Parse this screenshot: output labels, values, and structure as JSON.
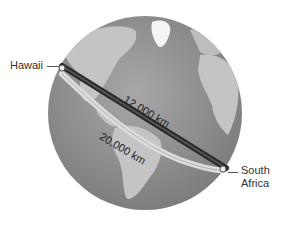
{
  "diagram": {
    "type": "globe-distance-comparison",
    "labels": {
      "origin": "Hawaii",
      "destination_line1": "South",
      "destination_line2": "Africa",
      "short_path": "12,000 km",
      "long_path": "20,000 km"
    },
    "colors": {
      "ocean": "#8f8f8f",
      "land": "#c4c4c4",
      "ice": "#ffffff",
      "short_path": "#2a2a2a",
      "long_path": "#d8d8d8"
    }
  }
}
